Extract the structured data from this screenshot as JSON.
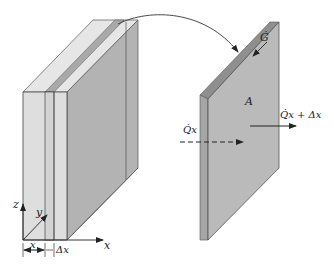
{
  "diagram": {
    "type": "heat-conduction-slab-control-volume",
    "colors": {
      "background": "#ffffff",
      "light_face": "#dcdcdc",
      "light_top": "#e8e8e8",
      "mid_face": "#c9c9c9",
      "dark_face": "#b4b4b4",
      "plate_face": "#b9b9b9",
      "plate_edge": "#9a9a9a",
      "stroke": "#3a3a3a"
    },
    "left_block": {
      "axis_labels": {
        "z": "z",
        "y": "y",
        "x": "x"
      },
      "dimension_labels": {
        "x": "x",
        "dx": "Δx"
      }
    },
    "right_plate": {
      "area_label": "A",
      "generation_label": "Ġ",
      "flux_in_label": "Q̇x",
      "flux_out_label": "Q̇x + Δx"
    }
  }
}
